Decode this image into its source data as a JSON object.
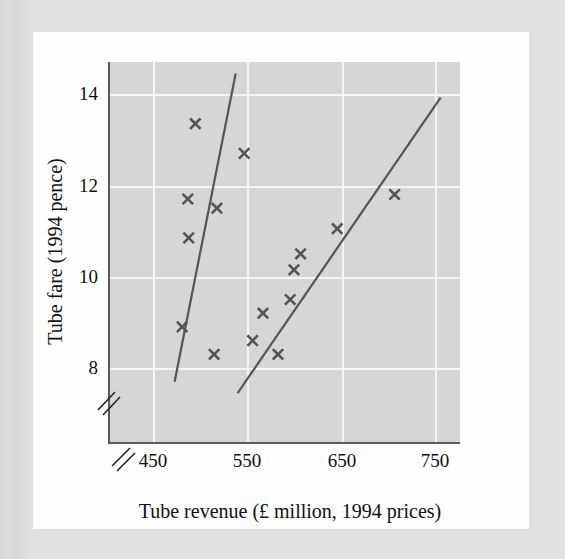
{
  "figure": {
    "background_color": "#d6d6d6",
    "page_color": "#fefefe",
    "border_color": "#d9d9d9",
    "marker_color": "#555555",
    "gridline_color": "#f4f4f4",
    "axis_color": "#5a5a5a"
  },
  "chart_data": {
    "type": "scatter",
    "title": "",
    "xlabel": "Tube revenue (£ million, 1994 prices)",
    "ylabel": "Tube fare (1994 pence)",
    "xticks": [
      450,
      550,
      650,
      750
    ],
    "xtick_labels": [
      "450",
      "550",
      "650",
      "750"
    ],
    "yticks": [
      8,
      10,
      12,
      14
    ],
    "ytick_labels": [
      "8",
      "10",
      "12",
      "14"
    ],
    "xlim": [
      407,
      779
    ],
    "ylim": [
      6.4,
      14.7
    ],
    "grid": true,
    "legend": "none",
    "axis_break_x": true,
    "axis_break_y": true,
    "marker_symbol": "x",
    "points": [
      {
        "x": 495,
        "y": 13.35
      },
      {
        "x": 547,
        "y": 12.7
      },
      {
        "x": 487,
        "y": 11.7
      },
      {
        "x": 518,
        "y": 11.5
      },
      {
        "x": 488,
        "y": 10.85
      },
      {
        "x": 481,
        "y": 8.9
      },
      {
        "x": 515,
        "y": 8.3
      },
      {
        "x": 556,
        "y": 8.6
      },
      {
        "x": 567,
        "y": 9.2
      },
      {
        "x": 583,
        "y": 8.3
      },
      {
        "x": 596,
        "y": 9.5
      },
      {
        "x": 600,
        "y": 10.15
      },
      {
        "x": 607,
        "y": 10.5
      },
      {
        "x": 646,
        "y": 11.05
      },
      {
        "x": 707,
        "y": 11.8
      }
    ],
    "lines": [
      {
        "name": "left-fit-line",
        "x1": 473,
        "y1": 7.7,
        "x2": 538,
        "y2": 14.45
      },
      {
        "name": "right-fit-line",
        "x1": 540,
        "y1": 7.45,
        "x2": 756,
        "y2": 13.92
      }
    ]
  }
}
